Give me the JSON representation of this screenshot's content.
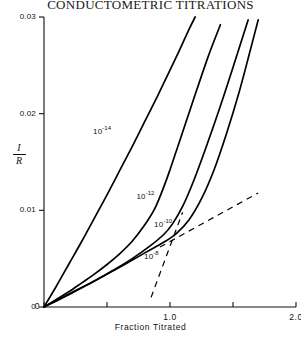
{
  "title": "CONDUCTOMETRIC TITRATIONS",
  "chart_data": {
    "type": "line",
    "title": "CONDUCTOMETRIC TITRATIONS",
    "xlabel": "Fraction Titrated",
    "ylabel": "I/R",
    "ylabel_numerator": "I",
    "ylabel_denominator": "R",
    "xlim": [
      0.0,
      2.0
    ],
    "ylim": [
      0.0,
      0.03
    ],
    "grid": false,
    "legend": "inline-curve-labels",
    "xticks": [
      0,
      0.5,
      1.0,
      1.5,
      2.0
    ],
    "xtick_labels": [
      "0",
      "",
      "1.0",
      "",
      "2.0"
    ],
    "yticks": [
      0,
      0.01,
      0.02,
      0.03
    ],
    "ytick_labels": [
      "0",
      "0.01",
      "0.02",
      "0.03"
    ],
    "series": [
      {
        "name": "10^-14",
        "label": "10",
        "exponent": "-14",
        "label_x": 0.5,
        "label_y": 0.0183,
        "points": [
          [
            0.0,
            0.0
          ],
          [
            0.1,
            0.0022
          ],
          [
            0.2,
            0.0045
          ],
          [
            0.3,
            0.0068
          ],
          [
            0.4,
            0.0092
          ],
          [
            0.5,
            0.0116
          ],
          [
            0.6,
            0.0141
          ],
          [
            0.7,
            0.0166
          ],
          [
            0.8,
            0.0192
          ],
          [
            0.9,
            0.0218
          ],
          [
            1.0,
            0.0245
          ],
          [
            1.08,
            0.0267
          ],
          [
            1.15,
            0.0287
          ],
          [
            1.2,
            0.03
          ]
        ]
      },
      {
        "name": "10^-12",
        "label": "10",
        "exponent": "-12",
        "label_x": 0.845,
        "label_y": 0.0116,
        "points": [
          [
            0.0,
            0.0
          ],
          [
            0.1,
            0.0008
          ],
          [
            0.2,
            0.0016
          ],
          [
            0.3,
            0.0025
          ],
          [
            0.4,
            0.0034
          ],
          [
            0.5,
            0.0044
          ],
          [
            0.6,
            0.0055
          ],
          [
            0.7,
            0.0068
          ],
          [
            0.8,
            0.0085
          ],
          [
            0.88,
            0.0102
          ],
          [
            0.95,
            0.0124
          ],
          [
            1.0,
            0.0142
          ],
          [
            1.08,
            0.0173
          ],
          [
            1.18,
            0.0212
          ],
          [
            1.3,
            0.0258
          ],
          [
            1.4,
            0.0292
          ]
        ]
      },
      {
        "name": "10^-10",
        "label": "10",
        "exponent": "-10",
        "label_x": 0.985,
        "label_y": 0.0087,
        "points": [
          [
            0.0,
            0.0
          ],
          [
            0.12,
            0.0008
          ],
          [
            0.25,
            0.0017
          ],
          [
            0.4,
            0.0027
          ],
          [
            0.55,
            0.0038
          ],
          [
            0.7,
            0.005
          ],
          [
            0.85,
            0.0064
          ],
          [
            0.95,
            0.0075
          ],
          [
            1.02,
            0.0086
          ],
          [
            1.1,
            0.0104
          ],
          [
            1.18,
            0.0128
          ],
          [
            1.28,
            0.0163
          ],
          [
            1.4,
            0.0208
          ],
          [
            1.52,
            0.0256
          ],
          [
            1.62,
            0.0297
          ]
        ]
      },
      {
        "name": "10^-8",
        "label": "10",
        "exponent": "-8",
        "label_x": 0.905,
        "label_y": 0.0054,
        "points": [
          [
            0.0,
            0.0
          ],
          [
            0.2,
            0.0013
          ],
          [
            0.4,
            0.0027
          ],
          [
            0.6,
            0.0041
          ],
          [
            0.8,
            0.0056
          ],
          [
            0.95,
            0.0067
          ],
          [
            1.05,
            0.0076
          ],
          [
            1.15,
            0.009
          ],
          [
            1.25,
            0.0112
          ],
          [
            1.35,
            0.0142
          ],
          [
            1.45,
            0.018
          ],
          [
            1.55,
            0.0223
          ],
          [
            1.63,
            0.0262
          ],
          [
            1.7,
            0.0297
          ]
        ]
      }
    ],
    "dashed_lines": [
      {
        "name": "shallow-asymptote",
        "points": [
          [
            0.92,
            0.0062
          ],
          [
            1.7,
            0.0118
          ]
        ]
      },
      {
        "name": "steep-asymptote",
        "points": [
          [
            0.85,
            0.001
          ],
          [
            1.1,
            0.0098
          ]
        ]
      }
    ]
  }
}
